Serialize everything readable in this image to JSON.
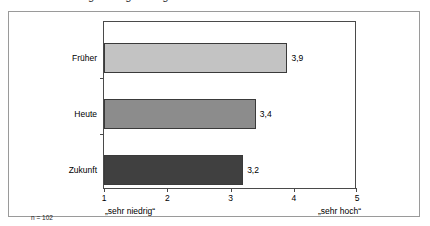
{
  "figure": {
    "clipped_caption_descenders": "g g g",
    "sample_size_note": "n = 102"
  },
  "chart_data": {
    "type": "bar",
    "orientation": "horizontal",
    "title": "",
    "xlabel": "",
    "ylabel": "",
    "categories": [
      "Früher",
      "Heute",
      "Zukunft"
    ],
    "values": [
      3.9,
      3.4,
      3.2
    ],
    "value_labels": [
      "3,9",
      "3,4",
      "3,2"
    ],
    "xlim": [
      1,
      5
    ],
    "xticks": [
      1,
      2,
      3,
      4,
      5
    ],
    "xtick_labels": [
      "1",
      "2",
      "3",
      "4",
      "5"
    ],
    "grid": false,
    "legend": false,
    "scale_anchor_low": "„sehr niedrig“",
    "scale_anchor_high": "„sehr hoch“",
    "bar_colors": [
      "#c3c3c3",
      "#8c8c8c",
      "#404040"
    ],
    "bar_edge_color": "#3a3a3a"
  }
}
